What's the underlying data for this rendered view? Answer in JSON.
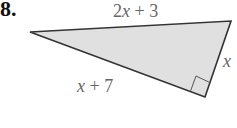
{
  "problem": {
    "number": "8."
  },
  "triangle": {
    "fill": "#e0e0e0",
    "stroke": "#333333",
    "vertices": {
      "left": [
        30,
        32
      ],
      "top_right": [
        231,
        21
      ],
      "bottom": [
        205,
        97
      ]
    },
    "right_angle_at": "bottom",
    "labels": {
      "top": {
        "var": "2x",
        "rest": " + 3"
      },
      "right": {
        "var": "x"
      },
      "bottom_left": {
        "var": "x",
        "rest": " + 7"
      }
    }
  }
}
